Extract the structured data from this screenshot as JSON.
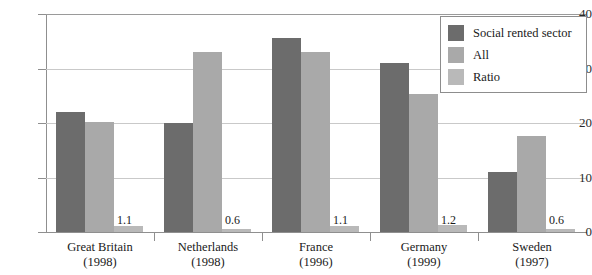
{
  "chart_data": {
    "type": "bar",
    "title": "",
    "xlabel": "",
    "ylabel": "",
    "ylim": [
      0,
      40
    ],
    "yticks": [
      0,
      10,
      20,
      30,
      40
    ],
    "grid": true,
    "legend_position": "top-right",
    "categories": [
      {
        "name": "Great Britain",
        "year": "(1998)"
      },
      {
        "name": "Netherlands",
        "year": "(1998)"
      },
      {
        "name": "France",
        "year": "(1996)"
      },
      {
        "name": "Germany",
        "year": "(1999)"
      },
      {
        "name": "Sweden",
        "year": "(1997)"
      }
    ],
    "series": [
      {
        "name": "Social rented sector",
        "color": "#6c6c6c",
        "values": [
          22.0,
          20.0,
          35.6,
          31.0,
          11.0
        ]
      },
      {
        "name": "All",
        "color": "#a9a9a9",
        "values": [
          20.1,
          33.0,
          33.0,
          25.3,
          17.7
        ]
      },
      {
        "name": "Ratio",
        "color": "#b9b9b9",
        "values": [
          1.1,
          0.6,
          1.1,
          1.2,
          0.6
        ]
      }
    ],
    "data_labels": [
      "1.1",
      "0.6",
      "1.1",
      "1.2",
      "0.6"
    ]
  }
}
